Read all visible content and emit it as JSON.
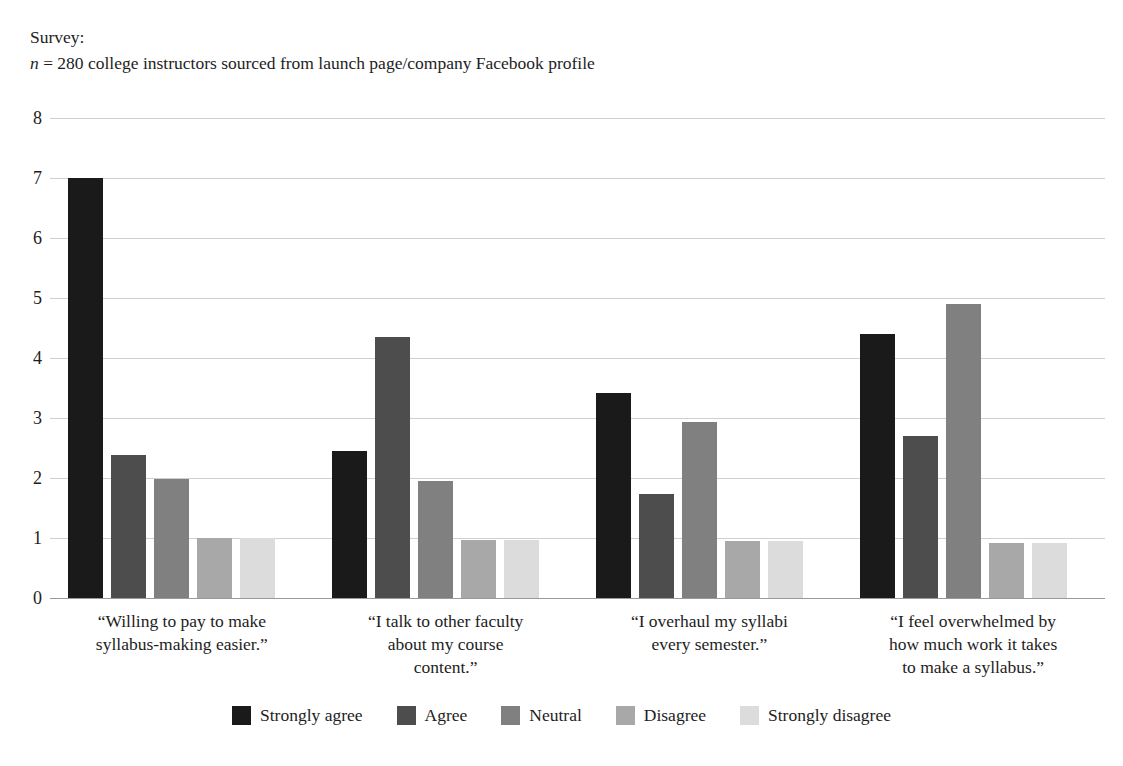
{
  "caption": {
    "line1": "Survey:",
    "line2_prefix": "n",
    "line2_rest": " = 280 college instructors sourced from launch page/company Facebook profile"
  },
  "chart_data": {
    "type": "bar",
    "title": "",
    "subtitle": "",
    "xlabel": "",
    "ylabel": "",
    "ylim": [
      0,
      8
    ],
    "yticks": [
      "0",
      "1",
      "2",
      "3",
      "4",
      "5",
      "6",
      "7",
      "8"
    ],
    "grid": true,
    "legend_position": "bottom",
    "categories": [
      "“Willing to pay to make syllabus-making easier.”",
      "“I talk to other faculty about my course content.”",
      "“I overhaul my syllabi every semester.”",
      "“I feel overwhelmed by how much work it takes to make a syllabus.”"
    ],
    "category_lines": [
      [
        "“Willing to pay to make",
        "syllabus-making easier.”"
      ],
      [
        "“I talk to other faculty",
        "about my course",
        "content.”"
      ],
      [
        "“I overhaul my syllabi",
        "every semester.”"
      ],
      [
        "“I feel overwhelmed by",
        "how much work it takes",
        "to make a syllabus.”"
      ]
    ],
    "series": [
      {
        "name": "Strongly agree",
        "color": "#1a1a1a",
        "values": [
          7.0,
          2.45,
          3.42,
          4.4
        ]
      },
      {
        "name": "Agree",
        "color": "#4d4d4d",
        "values": [
          2.38,
          4.35,
          1.74,
          2.7
        ]
      },
      {
        "name": "Neutral",
        "color": "#808080",
        "values": [
          1.99,
          1.95,
          2.93,
          4.9
        ]
      },
      {
        "name": "Disagree",
        "color": "#a8a8a8",
        "values": [
          1.0,
          0.97,
          0.95,
          0.92
        ]
      },
      {
        "name": "Strongly disagree",
        "color": "#dcdcdc",
        "values": [
          1.0,
          0.97,
          0.95,
          0.92
        ]
      }
    ]
  }
}
